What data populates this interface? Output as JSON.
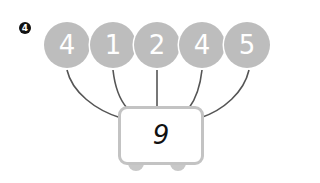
{
  "problem": {
    "number_badge": "4",
    "inputs": [
      "4",
      "1",
      "2",
      "4",
      "5"
    ],
    "result": "9"
  },
  "colors": {
    "circle_fill": "#bdbdbd",
    "circle_text": "#ffffff",
    "box_border": "#c3c3c3",
    "wire": "#555555",
    "badge": "#111111"
  }
}
